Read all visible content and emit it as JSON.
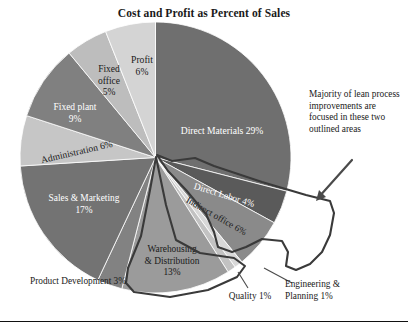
{
  "chart_data": {
    "type": "pie",
    "title": "Cost and Profit as Percent of Sales",
    "xlabel": "",
    "ylabel": "",
    "legend_position": "none",
    "grid": false,
    "units": "percent of sales",
    "start_angle_deg": 0,
    "direction": "clockwise",
    "categories": [
      "Direct Materials",
      "Direct Labor",
      "Indirect office",
      "Engineering & Planning",
      "Quality",
      "Warehousing & Distribution",
      "Product Development",
      "Sales & Marketing",
      "Administration",
      "Fixed plant",
      "Fixed office",
      "Profit"
    ],
    "values": [
      29,
      4,
      6,
      1,
      1,
      13,
      3,
      17,
      6,
      9,
      5,
      6
    ],
    "slices": [
      {
        "label": "Direct Materials",
        "value": 29,
        "label_text": "Direct Materials 29%",
        "color": "#6f6f6f",
        "text_color": "#ffffff",
        "lines": [
          "Direct Materials 29%"
        ],
        "lx": 222,
        "ly": 132,
        "rot": 0,
        "anchor": "middle",
        "fs": 9.6,
        "inside": true
      },
      {
        "label": "Direct Labor",
        "value": 4,
        "label_text": "Direct Labor 4%",
        "color": "#5a5a5a",
        "text_color": "#ffffff",
        "lines": [
          "Direct Labor 4%"
        ],
        "lx": 224,
        "ly": 196,
        "rot": 17,
        "anchor": "middle",
        "fs": 9.4,
        "inside": true
      },
      {
        "label": "Indirect office",
        "value": 6,
        "label_text": "Indirect office 6%",
        "color": "#8a8a8a",
        "text_color": "#1a1a1a",
        "lines": [
          "Indirect office 6%"
        ],
        "lx": 216,
        "ly": 217,
        "rot": 30,
        "anchor": "middle",
        "fs": 9.4,
        "inside": true
      },
      {
        "label": "Engineering & Planning",
        "value": 1,
        "label_text": "Engineering & Planning 1%",
        "color": "#d8d8d8",
        "text_color": "#1a1a1a",
        "lines": [],
        "lx": 0,
        "ly": 0,
        "rot": 0,
        "anchor": "middle",
        "fs": 9.3,
        "inside": false
      },
      {
        "label": "Quality",
        "value": 1,
        "label_text": "Quality 1%",
        "color": "#c2c2c2",
        "text_color": "#1a1a1a",
        "lines": [],
        "lx": 0,
        "ly": 0,
        "rot": 0,
        "anchor": "middle",
        "fs": 9.3,
        "inside": false
      },
      {
        "label": "Warehousing & Distribution",
        "value": 13,
        "label_text": "Warehousing & Distribution 13%",
        "color": "#9b9b9b",
        "text_color": "#1a1a1a",
        "lines": [
          "Warehousing",
          "& Distribution",
          "13%"
        ],
        "lx": 172,
        "ly": 250,
        "rot": 0,
        "anchor": "middle",
        "fs": 9.4,
        "inside": true
      },
      {
        "label": "Product Development",
        "value": 3,
        "label_text": "Product Development 3%",
        "color": "#828282",
        "text_color": "#1a1a1a",
        "lines": [],
        "lx": 0,
        "ly": 0,
        "rot": 0,
        "anchor": "middle",
        "fs": 9.3,
        "inside": false
      },
      {
        "label": "Sales & Marketing",
        "value": 17,
        "label_text": "Sales & Marketing 17%",
        "color": "#737373",
        "text_color": "#ffffff",
        "lines": [
          "Sales & Marketing",
          "17%"
        ],
        "lx": 84,
        "ly": 199,
        "rot": 0,
        "anchor": "middle",
        "fs": 9.4,
        "inside": true
      },
      {
        "label": "Administration",
        "value": 6,
        "label_text": "Administration 6%",
        "color": "#c6c6c6",
        "text_color": "#1a1a1a",
        "lines": [
          "Administration 6%"
        ],
        "lx": 77,
        "ly": 153,
        "rot": -13,
        "anchor": "middle",
        "fs": 9.6,
        "inside": true
      },
      {
        "label": "Fixed plant",
        "value": 9,
        "label_text": "Fixed plant 9%",
        "color": "#808080",
        "text_color": "#ffffff",
        "lines": [
          "Fixed plant",
          "9%"
        ],
        "lx": 75,
        "ly": 108,
        "rot": 0,
        "anchor": "middle",
        "fs": 9.5,
        "inside": true
      },
      {
        "label": "Fixed office",
        "value": 5,
        "label_text": "Fixed office 5%",
        "color": "#bdbdbd",
        "text_color": "#1a1a1a",
        "lines": [
          "Fixed",
          "office",
          "5%"
        ],
        "lx": 109,
        "ly": 70,
        "rot": 0,
        "anchor": "middle",
        "fs": 9.5,
        "inside": true
      },
      {
        "label": "Profit",
        "value": 6,
        "label_text": "Profit 6%",
        "color": "#d4d4d4",
        "text_color": "#1a1a1a",
        "lines": [
          "Profit",
          "6%"
        ],
        "lx": 142,
        "ly": 61,
        "rot": 0,
        "anchor": "middle",
        "fs": 9.6,
        "inside": true
      }
    ],
    "outside_labels": [
      {
        "name": "product-development",
        "text": "Product Development 3%"
      },
      {
        "name": "quality",
        "text": "Quality 1%"
      },
      {
        "name": "engineering-planning",
        "text": "Engineering & Planning 1%"
      }
    ],
    "annotations": [
      {
        "name": "lean-focus-note",
        "text": "Majority of lean process improvements are focused in these two outlined areas"
      }
    ]
  },
  "chart": {
    "title": "Cost and Profit as Percent of Sales",
    "annotation": "Majority of lean process improvements are focused in these two outlined areas",
    "labels": {
      "direct_materials": "Direct Materials 29%",
      "direct_labor": "Direct Labor 4%",
      "indirect_office": "Indirect office 6%",
      "warehousing_line1": "Warehousing",
      "warehousing_line2": "& Distribution",
      "warehousing_line3": "13%",
      "sales_marketing_line1": "Sales & Marketing",
      "sales_marketing_line2": "17%",
      "administration": "Administration 6%",
      "fixed_plant_line1": "Fixed plant",
      "fixed_plant_line2": "9%",
      "fixed_office_line1": "Fixed",
      "fixed_office_line2": "office",
      "fixed_office_line3": "5%",
      "profit_line1": "Profit",
      "profit_line2": "6%",
      "product_development": "Product Development 3%",
      "quality": "Quality 1%",
      "engineering_planning": "Engineering & Planning 1%"
    }
  },
  "colors": {
    "outline": "#3a3a3a",
    "leader": "#4a4a4a",
    "text": "#1a1a1a",
    "rule": "#111111"
  }
}
